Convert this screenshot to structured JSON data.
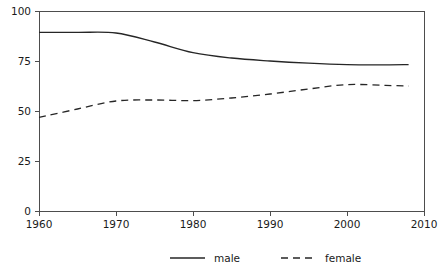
{
  "chart_data": {
    "type": "line",
    "title": "",
    "subtitle": "",
    "xlabel": "",
    "ylabel": "",
    "xlim": [
      1960,
      2010
    ],
    "ylim": [
      0,
      100
    ],
    "grid": false,
    "legend_position": "bottom",
    "x_ticks": [
      "1960",
      "1970",
      "1980",
      "1990",
      "2000",
      "2010"
    ],
    "x_tick_values": [
      1960,
      1970,
      1980,
      1990,
      2000,
      2010
    ],
    "y_ticks": [
      "0",
      "25",
      "50",
      "75",
      "100"
    ],
    "y_tick_values": [
      0,
      25,
      50,
      75,
      100
    ],
    "x": [
      1960,
      1965,
      1970,
      1975,
      1980,
      1985,
      1990,
      1995,
      2000,
      2005,
      2008
    ],
    "series": [
      {
        "name": "male",
        "style": "solid",
        "color": "#262626",
        "values": [
          89.3,
          89.3,
          89.0,
          84.5,
          79.2,
          76.5,
          75.0,
          73.9,
          73.2,
          73.1,
          73.2
        ]
      },
      {
        "name": "female",
        "style": "dashed",
        "color": "#262626",
        "values": [
          46.8,
          51.0,
          55.0,
          55.5,
          55.2,
          56.5,
          58.5,
          61.0,
          63.2,
          62.8,
          62.5
        ]
      }
    ]
  },
  "legend": {
    "items": [
      {
        "label": "male",
        "style": "solid"
      },
      {
        "label": "female",
        "style": "dashed"
      }
    ]
  },
  "colors": {
    "line": "#262626",
    "axis": "#4d4d4d",
    "text": "#1a1a1a",
    "background": "#ffffff"
  }
}
